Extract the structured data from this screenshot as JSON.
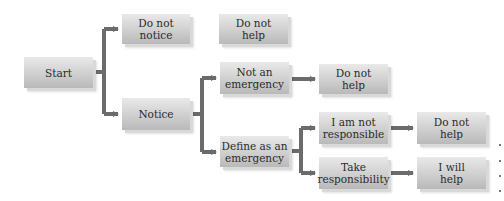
{
  "diagram": {
    "type": "flowchart",
    "colors": {
      "box_fill_top": "#e9e9e9",
      "box_fill_bottom": "#b9b9b9",
      "arrow": "#6b6b6b",
      "text": "#2b2b2b"
    },
    "nodes": {
      "start": "Start",
      "do_not_notice": "Do not\nnotice",
      "do_not_help_top": "Do not\nhelp",
      "notice": "Notice",
      "not_emergency": "Not an\nemergency",
      "do_not_help_mid": "Do not\nhelp",
      "define_emergency": "Define as an\nemergency",
      "not_responsible": "I am not\nresponsible",
      "do_not_help_low": "Do not\nhelp",
      "take_responsibility": "Take\nresponsibility",
      "will_help": "I will\nhelp"
    },
    "edges": [
      {
        "from": "start",
        "to": "do_not_notice"
      },
      {
        "from": "start",
        "to": "notice"
      },
      {
        "from": "notice",
        "to": "not_emergency"
      },
      {
        "from": "notice",
        "to": "define_emergency"
      },
      {
        "from": "not_emergency",
        "to": "do_not_help_mid"
      },
      {
        "from": "define_emergency",
        "to": "not_responsible"
      },
      {
        "from": "define_emergency",
        "to": "take_responsibility"
      },
      {
        "from": "not_responsible",
        "to": "do_not_help_low"
      },
      {
        "from": "take_responsibility",
        "to": "will_help"
      }
    ]
  }
}
